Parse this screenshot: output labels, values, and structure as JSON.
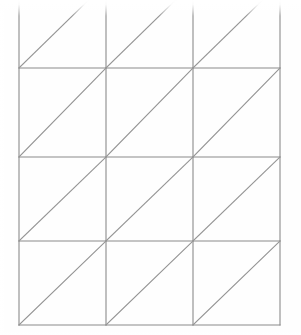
{
  "figure": {
    "background_color": "#ffffff",
    "line_color": "#8a8a8a",
    "diagonal_color": "#949494",
    "line_width": 1.1,
    "canvas": {
      "width": 301,
      "height": 335
    },
    "grid": {
      "columns": 3,
      "rows": 4,
      "cell_width": 87,
      "cell_height": 85,
      "x_positions": [
        19,
        106,
        193,
        280
      ],
      "y_positions": [
        -17,
        68,
        157,
        241,
        325
      ],
      "top_row_clipped": true,
      "diagonal_direction": "bottom-left-to-top-right"
    },
    "vertical_lines": [
      {
        "name": "vertical-line-1",
        "x": 19,
        "y1": -17,
        "y2": 325
      },
      {
        "name": "vertical-line-2",
        "x": 106,
        "y1": -17,
        "y2": 325
      },
      {
        "name": "vertical-line-3",
        "x": 193,
        "y1": -17,
        "y2": 325
      },
      {
        "name": "vertical-line-4",
        "x": 280,
        "y1": -17,
        "y2": 325
      }
    ],
    "horizontal_lines": [
      {
        "name": "horizontal-line-1",
        "y": 68,
        "x1": 19,
        "x2": 280
      },
      {
        "name": "horizontal-line-2",
        "y": 157,
        "x1": 19,
        "x2": 280
      },
      {
        "name": "horizontal-line-3",
        "y": 241,
        "x1": 19,
        "x2": 280
      },
      {
        "name": "horizontal-line-4",
        "y": 325,
        "x1": 19,
        "x2": 280
      }
    ],
    "diagonal_lines": [
      {
        "name": "diagonal-r1-c1",
        "x1": 19,
        "y1": 68,
        "x2": 106,
        "y2": -17
      },
      {
        "name": "diagonal-r1-c2",
        "x1": 106,
        "y1": 68,
        "x2": 193,
        "y2": -17
      },
      {
        "name": "diagonal-r1-c3",
        "x1": 193,
        "y1": 68,
        "x2": 280,
        "y2": -17
      },
      {
        "name": "diagonal-r2-c1",
        "x1": 19,
        "y1": 157,
        "x2": 106,
        "y2": 68
      },
      {
        "name": "diagonal-r2-c2",
        "x1": 106,
        "y1": 157,
        "x2": 193,
        "y2": 68
      },
      {
        "name": "diagonal-r2-c3",
        "x1": 193,
        "y1": 157,
        "x2": 280,
        "y2": 68
      },
      {
        "name": "diagonal-r3-c1",
        "x1": 19,
        "y1": 241,
        "x2": 106,
        "y2": 157
      },
      {
        "name": "diagonal-r3-c2",
        "x1": 106,
        "y1": 241,
        "x2": 193,
        "y2": 157
      },
      {
        "name": "diagonal-r3-c3",
        "x1": 193,
        "y1": 241,
        "x2": 280,
        "y2": 157
      },
      {
        "name": "diagonal-r4-c1",
        "x1": 19,
        "y1": 325,
        "x2": 106,
        "y2": 241
      },
      {
        "name": "diagonal-r4-c2",
        "x1": 106,
        "y1": 325,
        "x2": 193,
        "y2": 241
      },
      {
        "name": "diagonal-r4-c3",
        "x1": 193,
        "y1": 325,
        "x2": 280,
        "y2": 241
      }
    ]
  }
}
